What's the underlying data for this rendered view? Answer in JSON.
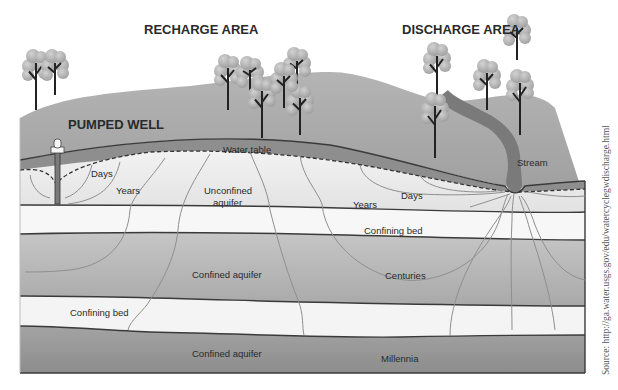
{
  "diagram": {
    "headings": {
      "recharge_area": "RECHARGE AREA",
      "discharge_area": "DISCHARGE AREA",
      "pumped_well": "PUMPED WELL"
    },
    "labels": {
      "water_table": "Water table",
      "stream": "Stream",
      "days_left": "Days",
      "years_left": "Years",
      "unconfined_aquifer_line1": "Unconfined",
      "unconfined_aquifer_line2": "aquifer",
      "years_right": "Years",
      "days_right": "Days",
      "confining_bed_upper": "Confining bed",
      "confined_aquifer_upper": "Confined aquifer",
      "centuries": "Centuries",
      "confining_bed_lower": "Confining bed",
      "confined_aquifer_lower": "Confined aquifer",
      "millennia": "Millennia"
    },
    "layers": [
      {
        "name": "land-surface",
        "color": "#a8a8a8"
      },
      {
        "name": "unsaturated-zone",
        "color": "#8e8e8e"
      },
      {
        "name": "unconfined-aquifer",
        "color": "#ececec"
      },
      {
        "name": "confining-bed",
        "color": "#f7f7f7"
      },
      {
        "name": "confined-aquifer",
        "color": "#b9b9b9"
      },
      {
        "name": "confined-aquifer-deep",
        "color": "#9a9a9a"
      }
    ],
    "source": "Source: http://ga.water.usgs.gov/edu/watercyclegwdischarge.html"
  }
}
